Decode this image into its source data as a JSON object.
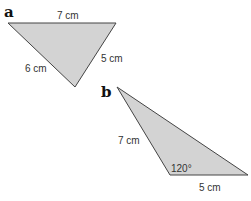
{
  "triangles": [
    {
      "id": "a",
      "label": "a",
      "sides": {
        "top": "7 cm",
        "right": "5 cm",
        "left": "6 cm"
      },
      "fill": "#d2d2d2"
    },
    {
      "id": "b",
      "label": "b",
      "sides": {
        "left": "7 cm",
        "bottom": "5 cm"
      },
      "angle": "120°",
      "fill": "#d2d2d2"
    }
  ]
}
